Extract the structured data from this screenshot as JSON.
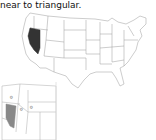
{
  "caption": {
    "text": "near to triangular."
  },
  "main_map": {
    "title": "United States map",
    "highlighted_state": "Nevada",
    "highlight_color": "#333333",
    "border_color": "#999999",
    "fill_color": "#ffffff"
  },
  "inset_map": {
    "title": "Western United States inset",
    "highlighted_state": "Nevada",
    "highlight_color": "#888888",
    "border_color": "#aaaaaa"
  }
}
